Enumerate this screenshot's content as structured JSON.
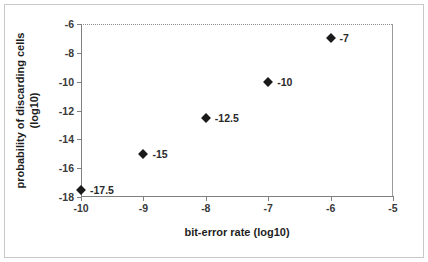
{
  "chart_data": {
    "type": "scatter",
    "title": "",
    "xlabel": "bit-error rate (log10)",
    "ylabel": "probability of discarding cells (log10)",
    "xlim": [
      -10,
      -5
    ],
    "ylim": [
      -18,
      -6
    ],
    "xticks": [
      "-10",
      "-9",
      "-8",
      "-7",
      "-6",
      "-5"
    ],
    "xtick_values": [
      -10,
      -9,
      -8,
      -7,
      -6,
      -5
    ],
    "yticks": [
      "-18",
      "-16",
      "-14",
      "-12",
      "-10",
      "-8",
      "-6"
    ],
    "ytick_values": [
      -18,
      -16,
      -14,
      -12,
      -10,
      -8,
      -6
    ],
    "grid": false,
    "legend": null,
    "marker": "diamond",
    "marker_color": "#1a1a1a",
    "x": [
      -10,
      -9,
      -8,
      -7,
      -6
    ],
    "y": [
      -17.5,
      -15,
      -12.5,
      -10,
      -7
    ],
    "point_labels": [
      "-17.5",
      "-15",
      "-12.5",
      "-10",
      "-7"
    ],
    "points": [
      {
        "x": -10,
        "y": -17.5,
        "label": "-17.5"
      },
      {
        "x": -9,
        "y": -15,
        "label": "-15"
      },
      {
        "x": -8,
        "y": -12.5,
        "label": "-12.5"
      },
      {
        "x": -7,
        "y": -10,
        "label": "-10"
      },
      {
        "x": -6,
        "y": -7,
        "label": "-7"
      }
    ]
  },
  "colors": {
    "axis": "#808080",
    "frame": "#c9c9c9",
    "text": "#1d1d1d",
    "marker": "#1a1a1a",
    "background": "#ffffff"
  }
}
